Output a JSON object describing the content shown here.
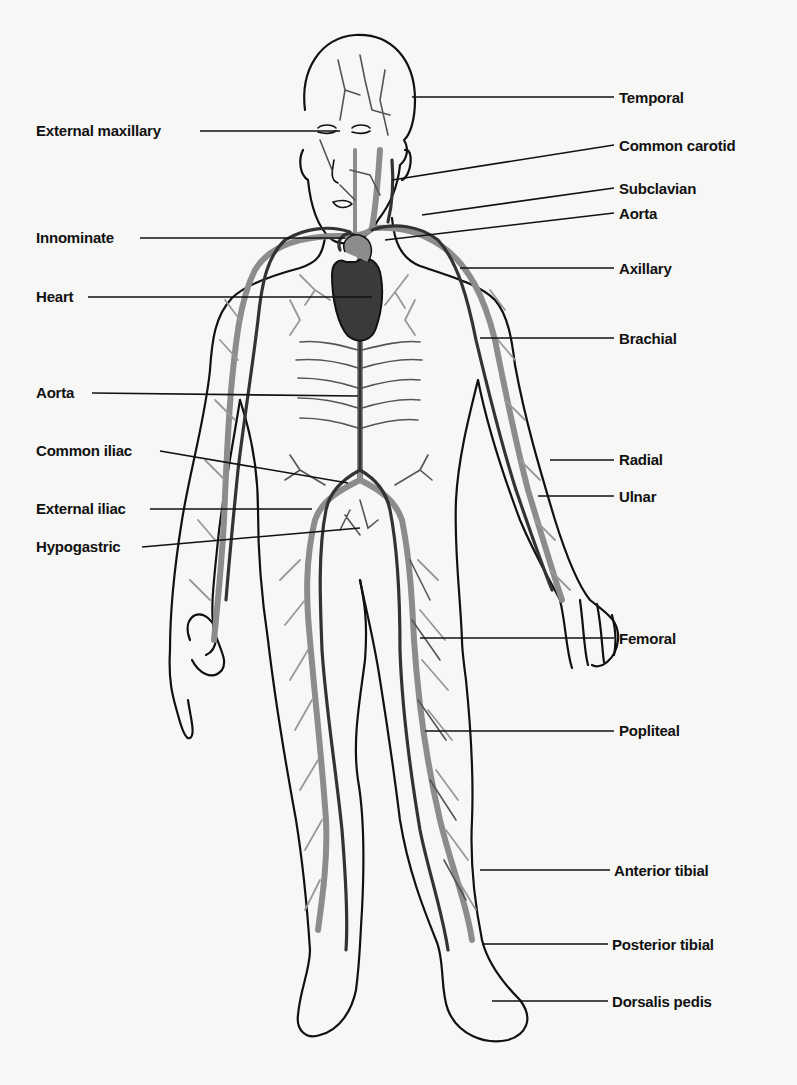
{
  "figure": {
    "colors": {
      "background": "#f7f7f5",
      "outline": "#111111",
      "artery": "#333333",
      "vein": "#8c8c8c",
      "heart": "#3a3a3a"
    }
  },
  "labels_left": [
    {
      "id": "external-maxillary",
      "text": "External maxillary",
      "x": 36,
      "y": 122
    },
    {
      "id": "innominate",
      "text": "Innominate",
      "x": 36,
      "y": 229
    },
    {
      "id": "heart",
      "text": "Heart",
      "x": 36,
      "y": 288
    },
    {
      "id": "aorta-abdominal",
      "text": "Aorta",
      "x": 36,
      "y": 384
    },
    {
      "id": "common-iliac",
      "text": "Common iliac",
      "x": 36,
      "y": 442
    },
    {
      "id": "external-iliac",
      "text": "External iliac",
      "x": 36,
      "y": 500
    },
    {
      "id": "hypogastric",
      "text": "Hypogastric",
      "x": 36,
      "y": 538
    }
  ],
  "labels_right": [
    {
      "id": "temporal",
      "text": "Temporal",
      "x": 619,
      "y": 89
    },
    {
      "id": "common-carotid",
      "text": "Common carotid",
      "x": 619,
      "y": 137
    },
    {
      "id": "subclavian",
      "text": "Subclavian",
      "x": 619,
      "y": 180
    },
    {
      "id": "aorta-arch",
      "text": "Aorta",
      "x": 619,
      "y": 205
    },
    {
      "id": "axillary",
      "text": "Axillary",
      "x": 619,
      "y": 260
    },
    {
      "id": "brachial",
      "text": "Brachial",
      "x": 619,
      "y": 330
    },
    {
      "id": "radial",
      "text": "Radial",
      "x": 619,
      "y": 451
    },
    {
      "id": "ulnar",
      "text": "Ulnar",
      "x": 619,
      "y": 488
    },
    {
      "id": "femoral",
      "text": "Femoral",
      "x": 619,
      "y": 630
    },
    {
      "id": "popliteal",
      "text": "Popliteal",
      "x": 619,
      "y": 722
    },
    {
      "id": "anterior-tibial",
      "text": "Anterior tibial",
      "x": 614,
      "y": 862
    },
    {
      "id": "posterior-tibial",
      "text": "Posterior tibial",
      "x": 612,
      "y": 936
    },
    {
      "id": "dorsalis-pedis",
      "text": "Dorsalis pedis",
      "x": 612,
      "y": 993
    }
  ]
}
